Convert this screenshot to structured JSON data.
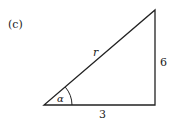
{
  "figure": {
    "panel_label": "(c)",
    "hypotenuse_label": "r",
    "vertical_side_label": "6",
    "horizontal_side_label": "3",
    "angle_label": "α",
    "stroke_color": "#222222"
  }
}
